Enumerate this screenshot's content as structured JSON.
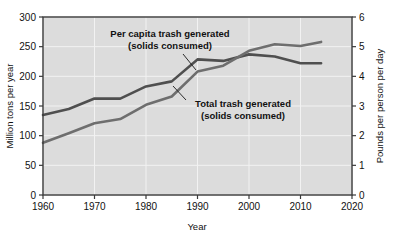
{
  "chart_data": {
    "type": "line",
    "title": "",
    "xlabel": "Year",
    "ylabel": "Million tons per year",
    "ylabel_right": "Pounds per person per day",
    "xlim": [
      1960,
      2020
    ],
    "ylim": [
      0,
      300
    ],
    "ylim_right": [
      0,
      6
    ],
    "grid": true,
    "legend_position": "inline-annotations",
    "background": "#dcdcdc",
    "x_ticks": [
      1960,
      1970,
      1980,
      1990,
      2000,
      2010,
      2020
    ],
    "x_tick_labels": [
      "1960",
      "1970",
      "1980",
      "1990",
      "2000",
      "2010",
      "2020"
    ],
    "y_ticks": [
      0,
      50,
      100,
      150,
      200,
      250,
      300
    ],
    "y_tick_labels": [
      "0",
      "50",
      "100",
      "150",
      "200",
      "250",
      "300"
    ],
    "y_ticks_right": [
      0,
      1,
      2,
      3,
      4,
      5,
      6
    ],
    "y_tick_labels_right": [
      "0",
      "1",
      "2",
      "3",
      "4",
      "5",
      "6"
    ],
    "series": [
      {
        "name": "Per capita trash generated (solids consumed)",
        "axis": "right",
        "units": "Pounds per person per day",
        "color": "#4f4f4f",
        "x": [
          1960,
          1965,
          1970,
          1975,
          1980,
          1985,
          1990,
          1995,
          2000,
          2005,
          2010,
          2014
        ],
        "values": [
          2.7,
          2.9,
          3.25,
          3.25,
          3.66,
          3.83,
          4.57,
          4.52,
          4.74,
          4.67,
          4.44,
          4.44
        ]
      },
      {
        "name": "Total trash generated (solids consumed)",
        "axis": "left",
        "units": "Million tons per year",
        "color": "#6e6e6e",
        "x": [
          1960,
          1965,
          1970,
          1975,
          1980,
          1985,
          1990,
          1995,
          2000,
          2005,
          2010,
          2014
        ],
        "values": [
          88,
          104,
          121,
          128,
          152,
          166,
          208,
          218,
          243,
          254,
          251,
          258
        ]
      }
    ],
    "annotations": [
      {
        "id": "annotation-per-capita",
        "line1": "Per capita trash generated",
        "line2": "(solids consumed)"
      },
      {
        "id": "annotation-total",
        "line1": "Total trash generated",
        "line2": "(solids consumed)"
      }
    ]
  },
  "colors": {
    "plot_background": "#dcdcdc",
    "frame": "#3a3a3a",
    "grid": "#f2f2f2",
    "series_per_capita": "#4f4f4f",
    "series_total": "#6e6e6e",
    "text": "#111111"
  }
}
